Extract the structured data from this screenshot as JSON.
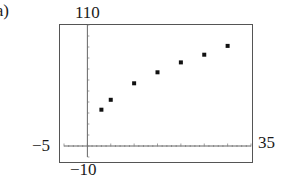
{
  "panel_label": "(a)",
  "window": {
    "xmin": "-5",
    "xmax": "35",
    "ymin": "-10",
    "ymax": "110"
  },
  "chart_data": {
    "type": "scatter",
    "title": "",
    "xlabel": "",
    "ylabel": "",
    "xlim": [
      -5,
      35
    ],
    "ylim": [
      -10,
      110
    ],
    "grid": false,
    "x_tick_spacing": 5,
    "y_tick_spacing": 10,
    "x": [
      3,
      5,
      10,
      15,
      20,
      25,
      30
    ],
    "y": [
      33,
      42,
      57,
      67,
      76,
      83,
      91
    ],
    "series": [
      {
        "name": "data",
        "x": [
          3,
          5,
          10,
          15,
          20,
          25,
          30
        ],
        "y": [
          33,
          42,
          57,
          67,
          76,
          83,
          91
        ]
      }
    ],
    "window_labels": {
      "xmin": "-5",
      "xmax": "35",
      "ymin": "-10",
      "ymax": "110"
    }
  }
}
